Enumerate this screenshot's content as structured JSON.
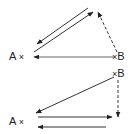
{
  "diagrams": [
    {
      "id": "top",
      "nodes": {
        "a": {
          "label": "A",
          "marker": "×"
        },
        "b": {
          "label": "B",
          "marker": "×"
        }
      },
      "edges": [
        {
          "from": "apex",
          "to": "A",
          "style": "solid"
        },
        {
          "from": "A",
          "to": "apex",
          "style": "solid"
        },
        {
          "from": "B",
          "to": "apex",
          "style": "dashed"
        },
        {
          "from": "B",
          "to": "A",
          "style": "solid"
        }
      ]
    },
    {
      "id": "bottom",
      "nodes": {
        "a": {
          "label": "A",
          "marker": "×"
        },
        "b": {
          "label": "B",
          "marker": "×"
        }
      },
      "edges": [
        {
          "from": "B",
          "to": "A",
          "style": "solid"
        },
        {
          "from": "B",
          "to": "down",
          "style": "dashed"
        },
        {
          "from": "A",
          "to": "right",
          "style": "solid"
        },
        {
          "from": "right",
          "to": "A",
          "style": "solid"
        }
      ]
    }
  ],
  "colors": {
    "line": "#333333",
    "background": "#ffffff"
  }
}
